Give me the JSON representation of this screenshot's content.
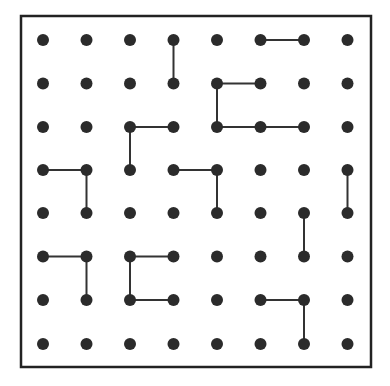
{
  "diagram": {
    "type": "dot-grid",
    "grid": {
      "cols": 8,
      "rows": 8,
      "x_positions": [
        43,
        86.5,
        130,
        173.5,
        217,
        260.5,
        304,
        347.5
      ],
      "y_positions": [
        40,
        83.5,
        127,
        170,
        213,
        256.5,
        300,
        344
      ]
    },
    "frame": {
      "x": 21,
      "y": 16,
      "width": 350,
      "height": 351,
      "stroke_width": 2.5
    },
    "style": {
      "dot_color": "#2b2b2b",
      "line_color": "#333333",
      "frame_color": "#222222",
      "background": "#ffffff",
      "dot_radius": 6,
      "line_width": 2
    },
    "segments": [
      {
        "from": [
          5,
          0
        ],
        "to": [
          6,
          0
        ]
      },
      {
        "from": [
          3,
          0
        ],
        "to": [
          3,
          1
        ]
      },
      {
        "from": [
          4,
          1
        ],
        "to": [
          5,
          1
        ]
      },
      {
        "from": [
          4,
          1
        ],
        "to": [
          4,
          2
        ]
      },
      {
        "from": [
          4,
          2
        ],
        "to": [
          5,
          2
        ]
      },
      {
        "from": [
          5,
          2
        ],
        "to": [
          6,
          2
        ]
      },
      {
        "from": [
          2,
          2
        ],
        "to": [
          3,
          2
        ]
      },
      {
        "from": [
          2,
          2
        ],
        "to": [
          2,
          3
        ]
      },
      {
        "from": [
          0,
          3
        ],
        "to": [
          1,
          3
        ]
      },
      {
        "from": [
          1,
          3
        ],
        "to": [
          1,
          4
        ]
      },
      {
        "from": [
          3,
          3
        ],
        "to": [
          4,
          3
        ]
      },
      {
        "from": [
          4,
          3
        ],
        "to": [
          4,
          4
        ]
      },
      {
        "from": [
          7,
          3
        ],
        "to": [
          7,
          4
        ]
      },
      {
        "from": [
          6,
          4
        ],
        "to": [
          6,
          5
        ]
      },
      {
        "from": [
          0,
          5
        ],
        "to": [
          1,
          5
        ]
      },
      {
        "from": [
          1,
          5
        ],
        "to": [
          1,
          6
        ]
      },
      {
        "from": [
          2,
          5
        ],
        "to": [
          3,
          5
        ]
      },
      {
        "from": [
          2,
          5
        ],
        "to": [
          2,
          6
        ]
      },
      {
        "from": [
          2,
          6
        ],
        "to": [
          3,
          6
        ]
      },
      {
        "from": [
          5,
          6
        ],
        "to": [
          6,
          6
        ]
      },
      {
        "from": [
          6,
          6
        ],
        "to": [
          6,
          7
        ]
      }
    ]
  }
}
